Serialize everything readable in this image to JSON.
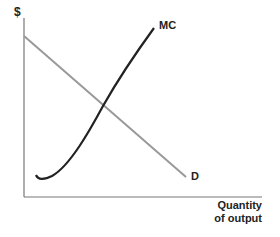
{
  "diagram": {
    "y_axis_label": "$",
    "x_axis_label_line1": "Quantity",
    "x_axis_label_line2": "of output",
    "curves": [
      {
        "name": "MC",
        "label": "MC",
        "color": "#222222",
        "description": "U-shaped marginal cost curve, rising steeply"
      },
      {
        "name": "D",
        "label": "D",
        "color": "#999999",
        "description": "Downward-sloping linear demand curve"
      }
    ],
    "axis_color": "#777777"
  }
}
